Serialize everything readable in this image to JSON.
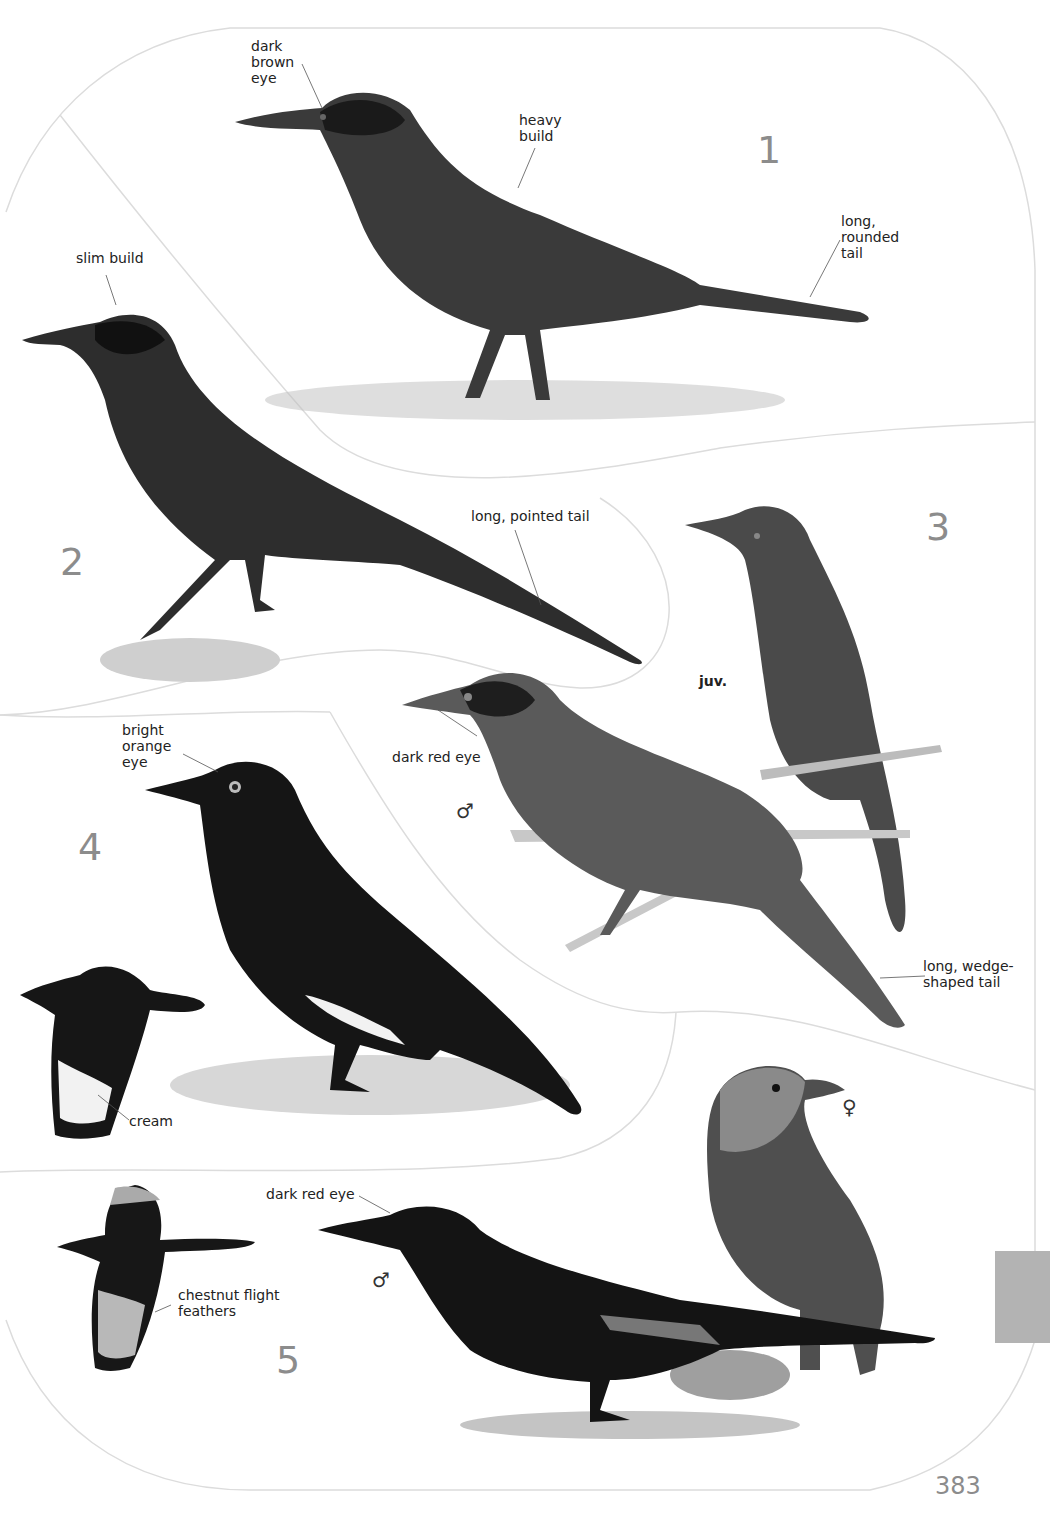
{
  "page": {
    "number": "383",
    "thumb_tab_color": "#b3b3b3",
    "separator_color": "#d9d9d9"
  },
  "species": [
    {
      "id": "1",
      "number": "1",
      "annotations": [
        {
          "key": "eye",
          "text": "dark\nbrown\neye"
        },
        {
          "key": "build",
          "text": "heavy\nbuild"
        },
        {
          "key": "tail",
          "text": "long,\nrounded\ntail"
        }
      ]
    },
    {
      "id": "2",
      "number": "2",
      "annotations": [
        {
          "key": "build",
          "text": "slim build"
        },
        {
          "key": "tail",
          "text": "long, pointed tail"
        }
      ]
    },
    {
      "id": "3",
      "number": "3",
      "annotations": [
        {
          "key": "juv",
          "text": "juv."
        },
        {
          "key": "eye",
          "text": "dark red eye"
        },
        {
          "key": "tail",
          "text": "long, wedge-\nshaped tail"
        }
      ],
      "sex_symbols": [
        "♂"
      ]
    },
    {
      "id": "4",
      "number": "4",
      "annotations": [
        {
          "key": "eye",
          "text": "bright\norange\neye"
        },
        {
          "key": "wing",
          "text": "cream"
        }
      ]
    },
    {
      "id": "5",
      "number": "5",
      "annotations": [
        {
          "key": "eye",
          "text": "dark red eye"
        },
        {
          "key": "wing",
          "text": "chestnut flight\nfeathers"
        }
      ],
      "sex_symbols": [
        "♂",
        "♀"
      ]
    }
  ]
}
